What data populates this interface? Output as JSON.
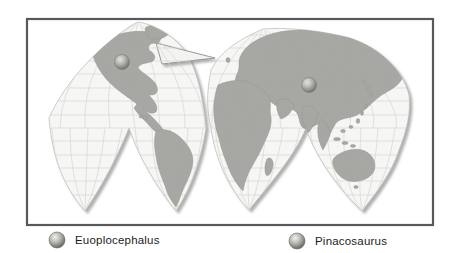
{
  "figure": {
    "kind": "interrupted-world-map",
    "legend": {
      "items": [
        {
          "label": "Euoplocephalus",
          "icon": "sphere-marker-icon"
        },
        {
          "label": "Pinacosaurus",
          "icon": "sphere-marker-icon"
        }
      ]
    },
    "map": {
      "markers": [
        {
          "label": "Euoplocephalus",
          "cx": "122",
          "cy": "62"
        },
        {
          "label": "Pinacosaurus",
          "cx": "309",
          "cy": "85"
        }
      ],
      "colors": {
        "land": "#a8a8a4",
        "ocean": "#f6f6f4",
        "graticule": "#d6d6d3",
        "frame": "#58595b",
        "shadow": "#8a8a8a",
        "marker_gray": "#9a9a97"
      }
    }
  }
}
